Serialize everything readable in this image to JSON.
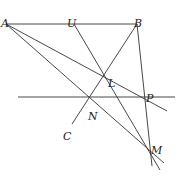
{
  "diagram": {
    "type": "geometry",
    "points": [
      {
        "name": "A",
        "x": 6,
        "y": 24,
        "lx": 1,
        "ly": 19
      },
      {
        "name": "U",
        "x": 74,
        "y": 24,
        "lx": 67,
        "ly": 19
      },
      {
        "name": "B",
        "x": 137,
        "y": 24,
        "lx": 134,
        "ly": 19
      },
      {
        "name": "L",
        "x": 104,
        "y": 73,
        "lx": 108,
        "ly": 79
      },
      {
        "name": "P",
        "x": 143,
        "y": 97,
        "lx": 146,
        "ly": 94
      },
      {
        "name": "N",
        "x": 90,
        "y": 97,
        "lx": 88,
        "ly": 112
      },
      {
        "name": "C",
        "x": 72,
        "y": 124,
        "lx": 63,
        "ly": 132
      },
      {
        "name": "M",
        "x": 147,
        "y": 154,
        "lx": 151,
        "ly": 146
      }
    ],
    "segments": [
      {
        "from": [
          6,
          24
        ],
        "to": [
          137,
          24
        ],
        "label": "AB"
      },
      {
        "from": [
          18,
          97
        ],
        "to": [
          175,
          97
        ],
        "label": "horizontal line through N,P"
      },
      {
        "from": [
          137,
          24
        ],
        "to": [
          72,
          124
        ],
        "label": "BC"
      },
      {
        "from": [
          137,
          24
        ],
        "to": [
          152,
          166
        ],
        "label": "B to M"
      },
      {
        "from": [
          74,
          24
        ],
        "to": [
          160,
          170
        ],
        "label": "U through L to M"
      },
      {
        "from": [
          6,
          24
        ],
        "to": [
          167,
          111
        ],
        "label": "A through L,P"
      },
      {
        "from": [
          6,
          24
        ],
        "to": [
          164,
          163
        ],
        "label": "A through N,M"
      }
    ]
  }
}
